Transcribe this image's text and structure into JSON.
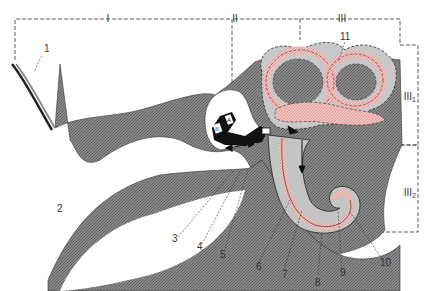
{
  "colors": {
    "tissue_gray": "#7a7a7a",
    "tissue_light": "#c4c4c4",
    "fluid_pink": "#f0b0ad",
    "bone_black": "#111111",
    "dash_line": "#333333"
  },
  "regions": {
    "outer": "I",
    "middle": "II",
    "inner": "III",
    "inner_vestibular": "III",
    "inner_vestibular_sub": "1",
    "inner_cochlear": "III",
    "inner_cochlear_sub": "2"
  },
  "labels": {
    "l1": "1",
    "l2": "2",
    "l3": "3",
    "l4": "4",
    "l5": "5",
    "l6": "6",
    "l7": "7",
    "l8": "8",
    "l9": "9",
    "l10": "10",
    "l11": "11"
  },
  "ossicles": {
    "malleus": "II",
    "incus": "A"
  }
}
